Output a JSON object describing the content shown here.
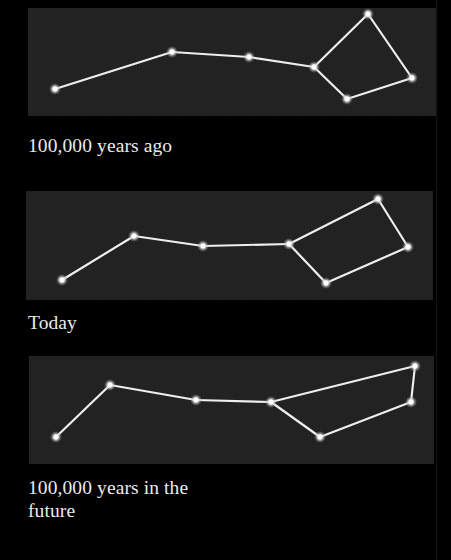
{
  "figure": {
    "colors": {
      "background": "#000000",
      "panel": "#222222",
      "line": "#eeeeee",
      "star": "#ffffff",
      "caption": "#ebebeb"
    }
  },
  "panels": [
    {
      "id": "past",
      "caption_lines": [
        "100,000 years ago"
      ],
      "box": {
        "x": 28,
        "y": 8,
        "w": 408,
        "h": 108
      },
      "stars": [
        [
          55,
          89
        ],
        [
          172,
          52
        ],
        [
          249,
          57
        ],
        [
          314,
          67
        ],
        [
          368,
          14
        ],
        [
          412,
          78
        ],
        [
          347,
          99
        ]
      ],
      "lines": [
        [
          0,
          1
        ],
        [
          1,
          2
        ],
        [
          2,
          3
        ],
        [
          3,
          4
        ],
        [
          4,
          5
        ],
        [
          5,
          6
        ],
        [
          6,
          3
        ]
      ]
    },
    {
      "id": "today",
      "caption_lines": [
        "Today"
      ],
      "box": {
        "x": 26,
        "y": 191,
        "w": 407,
        "h": 109
      },
      "stars": [
        [
          62,
          280
        ],
        [
          134,
          236
        ],
        [
          203,
          246
        ],
        [
          289,
          244
        ],
        [
          378,
          199
        ],
        [
          408,
          247
        ],
        [
          326,
          283
        ]
      ],
      "lines": [
        [
          0,
          1
        ],
        [
          1,
          2
        ],
        [
          2,
          3
        ],
        [
          3,
          4
        ],
        [
          4,
          5
        ],
        [
          5,
          6
        ],
        [
          6,
          3
        ]
      ]
    },
    {
      "id": "future",
      "caption_lines": [
        "100,000 years in the",
        "future"
      ],
      "box": {
        "x": 29,
        "y": 356,
        "w": 405,
        "h": 108
      },
      "stars": [
        [
          56,
          437
        ],
        [
          110,
          385
        ],
        [
          196,
          400
        ],
        [
          271,
          402
        ],
        [
          415,
          366
        ],
        [
          411,
          402
        ],
        [
          320,
          437
        ]
      ],
      "lines": [
        [
          0,
          1
        ],
        [
          1,
          2
        ],
        [
          2,
          3
        ],
        [
          3,
          4
        ],
        [
          4,
          5
        ],
        [
          5,
          6
        ],
        [
          6,
          3
        ]
      ]
    }
  ],
  "captions": {
    "past": "100,000 years ago",
    "today": "Today",
    "future_line1": "100,000 years in the",
    "future_line2": "future"
  }
}
